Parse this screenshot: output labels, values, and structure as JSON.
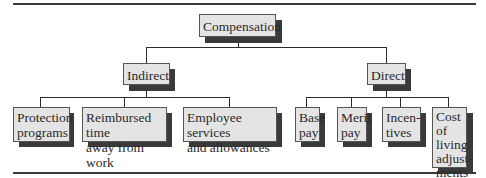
{
  "diagram": {
    "type": "org-chart",
    "root": {
      "label": "Compensation"
    },
    "level1": [
      {
        "label": "Indirect",
        "children": [
          "Protection\nprograms",
          "Reimbursed time\naway from work",
          "Employee services\nand allowances"
        ]
      },
      {
        "label": "Direct",
        "children": [
          "Base\npay",
          "Merit\npay",
          "Incen-\ntives",
          "Cost of\nliving\nadjust-\nments"
        ]
      }
    ]
  },
  "colors": {
    "box_fill": "#e4e4e4",
    "shadow": "#3a3a3a",
    "line": "#2b2b2b"
  }
}
